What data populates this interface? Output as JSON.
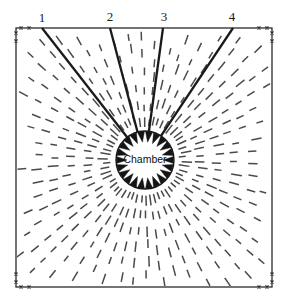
{
  "figure": {
    "title_text": "",
    "background_color": "#ffffff",
    "line_color": "#1a1a1a",
    "dash_color": "#4a4a4a",
    "frame": {
      "x": 16,
      "y": 28,
      "width": 256,
      "height": 259,
      "stroke_width": 1.3,
      "corner_tick_label": "x"
    },
    "chamber": {
      "label": "Chamber",
      "center_x": 145,
      "center_y": 160,
      "radius": 29,
      "arrow_count": 22,
      "arrow_length": 11,
      "arrow_half_width": 3.6,
      "stroke_width": 1.4
    },
    "fractures": [
      {
        "label": "1",
        "tip_x": 42,
        "tip_y": 28,
        "label_x": 42,
        "label_y": 22
      },
      {
        "label": "2",
        "tip_x": 110,
        "tip_y": 28,
        "label_x": 110,
        "label_y": 21
      },
      {
        "label": "3",
        "tip_x": 163,
        "tip_y": 28,
        "label_x": 164,
        "label_y": 21
      },
      {
        "label": "4",
        "tip_x": 233,
        "tip_y": 28,
        "label_x": 232,
        "label_y": 21
      }
    ],
    "radial_dash_field": {
      "ray_count": 54,
      "dash_length": 9,
      "dash_gap": 7,
      "inner_start_radius": 34,
      "max_radius": 230,
      "stroke_width": 1.5
    },
    "corner_ticks": {
      "offsets": [
        5,
        13
      ],
      "size": 3
    }
  }
}
